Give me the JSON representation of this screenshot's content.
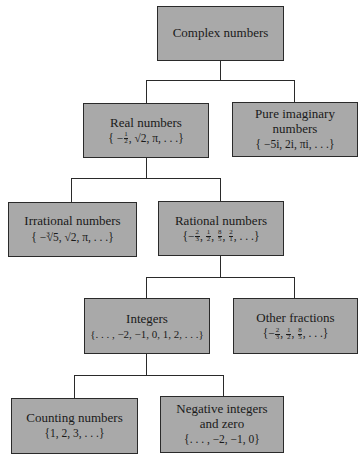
{
  "diagram": {
    "type": "tree",
    "nodes": [
      {
        "id": "complex",
        "title": "Complex numbers",
        "set": ""
      },
      {
        "id": "real",
        "title": "Real numbers",
        "set_parts": [
          "{ −",
          "1",
          "2",
          ", √2, π, . . .}"
        ]
      },
      {
        "id": "pure_imaginary",
        "title_line1": "Pure imaginary",
        "title_line2": "numbers",
        "set": "{ −5i, 2i,  πi, . . .}"
      },
      {
        "id": "irrational",
        "title": "Irrational numbers",
        "set_parts": [
          "{ −",
          "3",
          "√5",
          ", ",
          "√2",
          ", π, . . .}"
        ]
      },
      {
        "id": "rational",
        "title": "Rational numbers",
        "set_fracs": [
          [
            "−",
            "2",
            "3"
          ],
          [
            "",
            "1",
            "2"
          ],
          [
            "",
            "8",
            "5"
          ],
          [
            "",
            "2",
            "1"
          ]
        ],
        "set_end": ". . .}"
      },
      {
        "id": "integers",
        "title": "Integers",
        "set": "{. . . , −2, −1, 0, 1, 2, . . .}"
      },
      {
        "id": "other_fractions",
        "title": "Other fractions",
        "set_fracs": [
          [
            "−",
            "2",
            "3"
          ],
          [
            "",
            "1",
            "2"
          ],
          [
            "",
            "8",
            "5"
          ]
        ],
        "set_end": ". . .}"
      },
      {
        "id": "counting",
        "title": "Counting numbers",
        "set": "{1, 2, 3, . . .}"
      },
      {
        "id": "negative_integers_zero",
        "title_line1": "Negative integers",
        "title_line2": "and zero",
        "set": "{. . . , −2, −1, 0}"
      }
    ],
    "edges": [
      [
        "complex",
        "real"
      ],
      [
        "complex",
        "pure_imaginary"
      ],
      [
        "real",
        "irrational"
      ],
      [
        "real",
        "rational"
      ],
      [
        "rational",
        "integers"
      ],
      [
        "rational",
        "other_fractions"
      ],
      [
        "integers",
        "counting"
      ],
      [
        "integers",
        "negative_integers_zero"
      ]
    ],
    "colors": {
      "box_fill": "#a9a9a9",
      "border": "#2a2a2a",
      "background": "#ffffff"
    }
  }
}
